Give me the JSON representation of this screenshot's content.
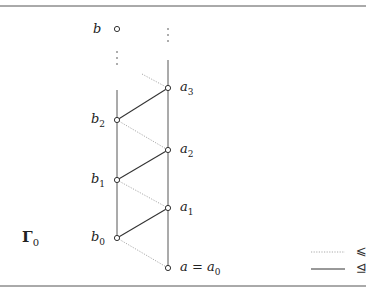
{
  "diagram": {
    "title_symbol": "Γ",
    "title_subscript": "0",
    "nodes": [
      {
        "id": "b",
        "label": "b",
        "sub": ""
      },
      {
        "id": "a3",
        "label": "a",
        "sub": "3"
      },
      {
        "id": "b2",
        "label": "b",
        "sub": "2"
      },
      {
        "id": "a2",
        "label": "a",
        "sub": "2"
      },
      {
        "id": "b1",
        "label": "b",
        "sub": "1"
      },
      {
        "id": "a1",
        "label": "a",
        "sub": "1"
      },
      {
        "id": "b0",
        "label": "b",
        "sub": "0"
      },
      {
        "id": "a0",
        "label": "a = a",
        "sub": "0"
      }
    ],
    "legend": [
      {
        "style": "dotted",
        "symbol": "⩽"
      },
      {
        "style": "solid",
        "symbol": "⊴"
      }
    ],
    "ellipsis": "⋮"
  }
}
